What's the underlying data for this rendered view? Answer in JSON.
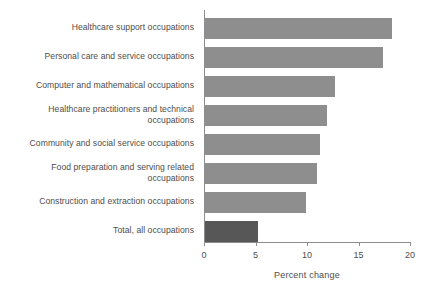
{
  "chart_data": {
    "type": "bar",
    "orientation": "horizontal",
    "title": "",
    "xlabel": "Percent change",
    "ylabel": "",
    "xlim": [
      0,
      20
    ],
    "xticks": [
      0,
      5,
      10,
      15,
      20
    ],
    "xtick_labels": [
      "0",
      "5",
      "10",
      "15",
      "20"
    ],
    "grid": false,
    "legend": null,
    "categories": [
      "Healthcare support occupations",
      "Personal care and service occupations",
      "Computer and mathematical occupations",
      "Healthcare practitioners and technical\noccupations",
      "Community and social service occupations",
      "Food preparation and serving related\noccupations",
      "Construction and extraction occupations",
      "Total, all occupations"
    ],
    "values": [
      18.2,
      17.3,
      12.6,
      11.8,
      11.2,
      10.9,
      9.8,
      5.1
    ],
    "bar_colors": [
      "#8e8e8e",
      "#8e8e8e",
      "#8e8e8e",
      "#8e8e8e",
      "#8e8e8e",
      "#8e8e8e",
      "#8e8e8e",
      "#575757"
    ],
    "highlight_index": 7,
    "colors": {
      "bar": "#8e8e8e",
      "bar_highlight": "#575757",
      "axis": "#8d8d8d",
      "text": "#4d4d4d",
      "background": "#ffffff"
    }
  }
}
